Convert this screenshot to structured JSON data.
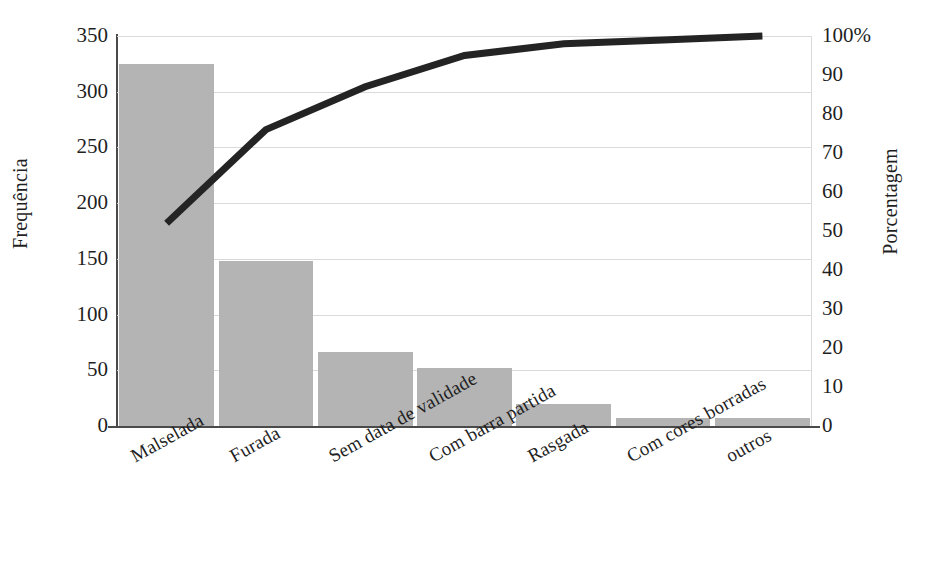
{
  "chart_data": {
    "type": "bar",
    "title": "",
    "subtitle": "",
    "xlabel": "",
    "ylabel": "Frequência",
    "y2label": "Porcentagem",
    "categories": [
      "Malselada",
      "Furada",
      "Sem data de validade",
      "Com barra partida",
      "Rasgada",
      "Com cores borradas",
      "outros"
    ],
    "series": [
      {
        "name": "Frequência",
        "type": "bar",
        "axis": "left",
        "color": "#b4b4b4",
        "values": [
          325,
          148,
          66,
          52,
          20,
          7,
          7
        ]
      },
      {
        "name": "Porcentagem acumulada",
        "type": "line",
        "axis": "right",
        "color": "#242424",
        "values": [
          52,
          76,
          87,
          95,
          98,
          99,
          100
        ]
      }
    ],
    "ylim": [
      0,
      350
    ],
    "yticks": [
      0,
      50,
      100,
      150,
      200,
      250,
      300,
      350
    ],
    "ytick_labels": [
      "0",
      "50",
      "100",
      "150",
      "200",
      "250",
      "300",
      "350"
    ],
    "y2lim": [
      0,
      100
    ],
    "y2ticks": [
      0,
      10,
      20,
      30,
      40,
      50,
      60,
      70,
      80,
      90,
      100
    ],
    "y2tick_labels": [
      "0",
      "10",
      "20",
      "30",
      "40",
      "50",
      "60",
      "70",
      "80",
      "90",
      "100%"
    ],
    "grid": true,
    "grid_axis": "y",
    "legend": "none",
    "annotations": []
  },
  "axis": {
    "left_title": "Frequência",
    "right_title": "Porcentagem"
  }
}
